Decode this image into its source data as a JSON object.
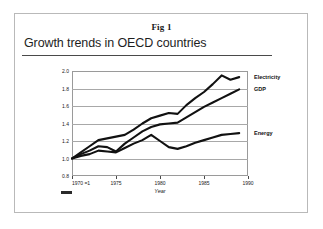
{
  "figure": {
    "number_caption": "Fig 1",
    "title": "Growth trends in OECD countries",
    "source_mark": "source-credit-mark"
  },
  "chart_data": {
    "type": "line",
    "title": "Growth trends in OECD countries",
    "xlabel": "Year",
    "ylabel": "",
    "xlim": [
      1970,
      1990
    ],
    "ylim": [
      0.8,
      2.0
    ],
    "grid": true,
    "legend_position": "right-inline",
    "ytick_labels": [
      "2.0",
      "1.8",
      "1.6",
      "1.4",
      "1.2",
      "1.0",
      "0.8"
    ],
    "ytick_values": [
      2.0,
      1.8,
      1.6,
      1.4,
      1.2,
      1.0,
      0.8
    ],
    "xtick_labels": [
      "1970 =1",
      "1975",
      "1980",
      "1985",
      "1990"
    ],
    "xtick_values": [
      1970,
      1975,
      1980,
      1985,
      1990
    ],
    "baseline_note": "1970 =1",
    "x": [
      1970,
      1971,
      1972,
      1973,
      1974,
      1975,
      1976,
      1977,
      1978,
      1979,
      1980,
      1981,
      1982,
      1983,
      1984,
      1985,
      1986,
      1987,
      1988,
      1989
    ],
    "series": [
      {
        "name": "Electricity",
        "color": "#111111",
        "label_value": 1.93,
        "values": [
          1.0,
          1.07,
          1.14,
          1.21,
          1.23,
          1.25,
          1.27,
          1.33,
          1.4,
          1.46,
          1.49,
          1.52,
          1.51,
          1.61,
          1.69,
          1.76,
          1.85,
          1.95,
          1.9,
          1.93
        ]
      },
      {
        "name": "GDP",
        "color": "#111111",
        "label_value": 1.79,
        "values": [
          1.0,
          1.05,
          1.09,
          1.14,
          1.13,
          1.08,
          1.17,
          1.24,
          1.31,
          1.36,
          1.39,
          1.4,
          1.41,
          1.47,
          1.53,
          1.59,
          1.64,
          1.69,
          1.74,
          1.79
        ]
      },
      {
        "name": "Energy",
        "color": "#111111",
        "label_value": 1.29,
        "values": [
          1.0,
          1.03,
          1.05,
          1.09,
          1.08,
          1.07,
          1.12,
          1.17,
          1.21,
          1.27,
          1.2,
          1.13,
          1.11,
          1.14,
          1.18,
          1.21,
          1.24,
          1.27,
          1.28,
          1.29
        ]
      }
    ]
  }
}
